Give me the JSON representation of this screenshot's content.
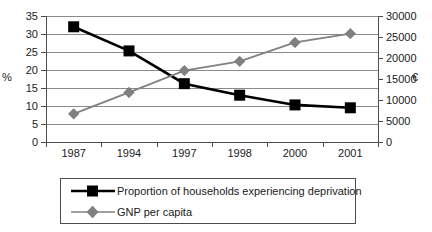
{
  "chart_data": {
    "type": "line",
    "title": "",
    "xlabel": "",
    "categories": [
      "1987",
      "1994",
      "1997",
      "1998",
      "2000",
      "2001"
    ],
    "grid": true,
    "legend_position": "bottom",
    "axes": {
      "left": {
        "label": "%",
        "ticks": [
          "0",
          "5",
          "10",
          "15",
          "20",
          "25",
          "30",
          "35"
        ],
        "min": 0,
        "max": 35
      },
      "right": {
        "label": "€",
        "ticks": [
          "0",
          "5000",
          "10000",
          "15000",
          "20000",
          "25000",
          "30000"
        ],
        "min": 0,
        "max": 30000
      }
    },
    "series": [
      {
        "name": "Proportion of households experiencing deprivation",
        "axis": "left",
        "color": "#000000",
        "marker": "square",
        "values": [
          32,
          25.3,
          16.2,
          13,
          10.3,
          9.5
        ]
      },
      {
        "name": "GNP per capita",
        "axis": "right",
        "color": "#808080",
        "marker": "diamond",
        "values": [
          6700,
          11800,
          17000,
          19200,
          23700,
          25800
        ]
      }
    ]
  },
  "legend": {
    "entries": [
      {
        "label": "Proportion of households experiencing deprivation"
      },
      {
        "label": "GNP per capita"
      }
    ]
  }
}
